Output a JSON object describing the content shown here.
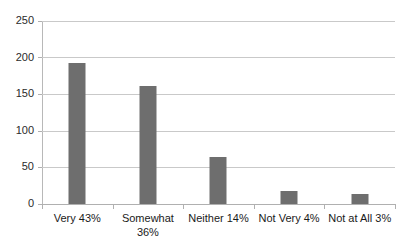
{
  "chart_data": {
    "type": "bar",
    "title": "",
    "subtitle": "",
    "xlabel": "",
    "ylabel": "",
    "categories": [
      "Very 43%",
      "Somewhat 36%",
      "Neither 14%",
      "Not Very 4%",
      "Not at All 3%"
    ],
    "values": [
      193,
      161,
      64,
      18,
      14
    ],
    "ylim": [
      0,
      250
    ],
    "yticks": [
      0,
      50,
      100,
      150,
      200,
      250
    ],
    "ytick_labels": [
      "0",
      "50",
      "100",
      "150",
      "200",
      "250"
    ],
    "grid": true,
    "legend": false,
    "legend_position": "none",
    "series": [
      {
        "name": "Responses",
        "values": [
          193,
          161,
          64,
          18,
          14
        ]
      }
    ],
    "percent_labels": [
      "43%",
      "36%",
      "14%",
      "4%",
      "3%"
    ],
    "category_names": [
      "Very",
      "Somewhat",
      "Neither",
      "Not Very",
      "Not at All"
    ],
    "colors": {
      "bar": "#6e6e6e",
      "gridline": "#c9c9c9",
      "axis": "#b0b0b0",
      "background": "#ffffff",
      "text": "#1a1a1a"
    }
  }
}
